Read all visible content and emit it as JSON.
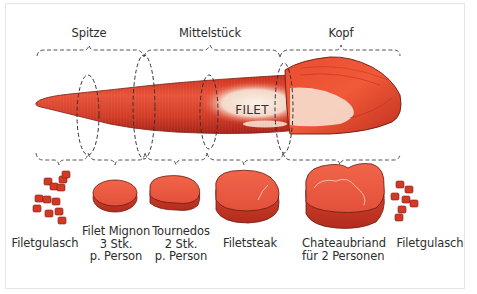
{
  "diagram": {
    "title_label": "FILET",
    "colors": {
      "meat_dark": "#a8231a",
      "meat": "#d8402a",
      "meat_light": "#f0603d",
      "fat": "#f6e6d8",
      "outline": "#6a1a12",
      "dashed_line": "#555555",
      "text": "#2d2d2d",
      "frame_border": "#e6e6e6"
    },
    "sections": [
      {
        "label": "Spitze",
        "x_start": 37,
        "x_end": 144
      },
      {
        "label": "Mittelstück",
        "x_start": 144,
        "x_end": 280
      },
      {
        "label": "Kopf",
        "x_start": 280,
        "x_end": 400
      }
    ],
    "cuts": [
      {
        "name": "Filetgulasch",
        "lines": [
          "Filetgulasch"
        ],
        "shape": "cubes"
      },
      {
        "name": "Filet Mignon",
        "lines": [
          "Filet Mignon",
          "3 Stk.",
          "p. Person"
        ],
        "shape": "small-round-steak"
      },
      {
        "name": "Tournedos",
        "lines": [
          "Tournedos",
          "2 Stk.",
          "p. Person"
        ],
        "shape": "medium-steak"
      },
      {
        "name": "Filetsteak",
        "lines": [
          "Filetsteak"
        ],
        "shape": "large-steak"
      },
      {
        "name": "Chateaubriand",
        "lines": [
          "Chateaubriand",
          "für 2 Personen"
        ],
        "shape": "xl-steak"
      },
      {
        "name": "Filetgulasch",
        "lines": [
          "Filetgulasch"
        ],
        "shape": "cubes"
      }
    ]
  }
}
